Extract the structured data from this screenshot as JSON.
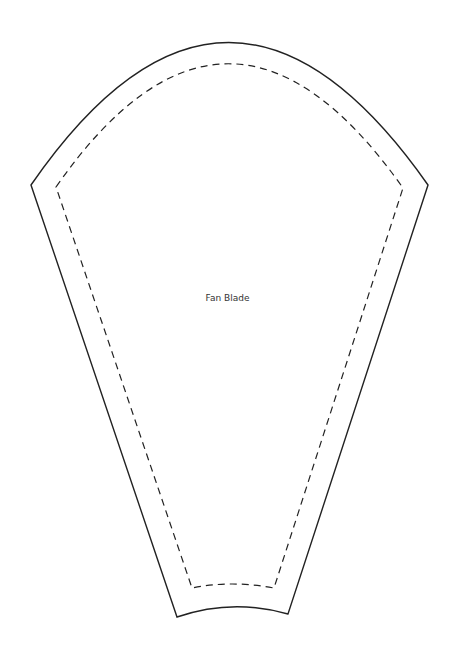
{
  "template": {
    "title": "Fan Blade",
    "outline_color": "#222222",
    "outer_line": "cut line (solid)",
    "inner_line": "seam line (dashed)"
  }
}
